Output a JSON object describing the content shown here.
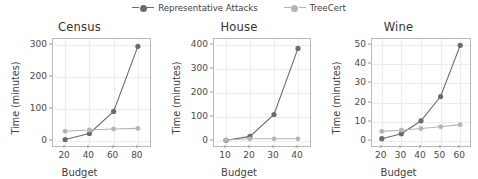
{
  "legend": {
    "entries": [
      {
        "label": "Representative Attacks",
        "color": "#6b6b6b",
        "marker": "legend-marker-representative-attacks"
      },
      {
        "label": "TreeCert",
        "color": "#b4b4b4",
        "marker": "legend-marker-treecert"
      }
    ]
  },
  "colors": {
    "representative_attacks": "#6b6b6b",
    "treecert": "#b4b4b4",
    "axis": "#b9b9b9",
    "grid": "#ededed",
    "text": "#444444"
  },
  "chart_data": [
    {
      "type": "line",
      "title": "Census",
      "xlabel": "Budget",
      "ylabel": "Time (minutes)",
      "x": [
        20,
        40,
        60,
        80
      ],
      "xticks": [
        "20",
        "40",
        "60",
        "80"
      ],
      "yticks": [
        "0",
        "100",
        "200",
        "300"
      ],
      "xlim": [
        10,
        90
      ],
      "ylim": [
        -16,
        318
      ],
      "grid": true,
      "legend_position": "figure-top-center",
      "series": [
        {
          "name": "Representative Attacks",
          "values": [
            4,
            23,
            92,
            295
          ]
        },
        {
          "name": "TreeCert",
          "values": [
            30,
            34,
            37,
            39
          ]
        }
      ]
    },
    {
      "type": "line",
      "title": "House",
      "xlabel": "Budget",
      "ylabel": "Time (minutes)",
      "x": [
        10,
        20,
        30,
        40
      ],
      "xticks": [
        "10",
        "20",
        "30",
        "40"
      ],
      "yticks": [
        "0",
        "100",
        "200",
        "300",
        "400"
      ],
      "xlim": [
        5,
        45
      ],
      "ylim": [
        -21,
        424
      ],
      "grid": true,
      "legend_position": "figure-top-center",
      "series": [
        {
          "name": "Representative Attacks",
          "values": [
            3,
            19,
            110,
            385
          ]
        },
        {
          "name": "TreeCert",
          "values": [
            4,
            9,
            9,
            9
          ]
        }
      ]
    },
    {
      "type": "line",
      "title": "Wine",
      "xlabel": "Budget",
      "ylabel": "Time (minutes)",
      "x": [
        20,
        30,
        40,
        50,
        60
      ],
      "xticks": [
        "20",
        "30",
        "40",
        "50",
        "60"
      ],
      "yticks": [
        "0",
        "10",
        "20",
        "30",
        "40",
        "50"
      ],
      "xlim": [
        15,
        65
      ],
      "ylim": [
        -2.6,
        53
      ],
      "grid": true,
      "legend_position": "figure-top-center",
      "series": [
        {
          "name": "Representative Attacks",
          "values": [
            1.2,
            3.8,
            10.5,
            23.1,
            49.7
          ]
        },
        {
          "name": "TreeCert",
          "values": [
            5.0,
            5.6,
            6.5,
            7.4,
            8.5
          ]
        }
      ]
    }
  ]
}
